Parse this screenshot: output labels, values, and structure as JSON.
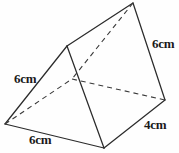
{
  "figure": {
    "name": "triangular-prism",
    "background_color": "#fefefe",
    "solid_edge_color": "#2b2b2b",
    "hidden_edge_color": "#3a3a3a",
    "label_color": "#1a1a1a",
    "vertices": {
      "apex_back_top": [
        133,
        3
      ],
      "apex_front_top": [
        67,
        46
      ],
      "left_front_bottom": [
        5,
        124
      ],
      "hidden_back_bottom": [
        72,
        79
      ],
      "front_bottom": [
        104,
        148
      ],
      "right_back_bottom": [
        165,
        100
      ]
    },
    "solid_edges": [
      [
        [
          67,
          46
        ],
        [
          133,
          3
        ]
      ],
      [
        [
          133,
          3
        ],
        [
          165,
          100
        ]
      ],
      [
        [
          67,
          46
        ],
        [
          5,
          124
        ]
      ],
      [
        [
          5,
          124
        ],
        [
          104,
          148
        ]
      ],
      [
        [
          67,
          46
        ],
        [
          104,
          148
        ]
      ],
      [
        [
          104,
          148
        ],
        [
          165,
          100
        ]
      ]
    ],
    "hidden_edges": [
      [
        [
          5,
          124
        ],
        [
          72,
          79
        ]
      ],
      [
        [
          72,
          79
        ],
        [
          165,
          100
        ]
      ],
      [
        [
          133,
          3
        ],
        [
          72,
          79
        ]
      ]
    ],
    "labels": {
      "left_slant": "6cm",
      "bottom_base": "6cm",
      "right_vertical": "6cm",
      "right_depth": "4cm"
    }
  }
}
